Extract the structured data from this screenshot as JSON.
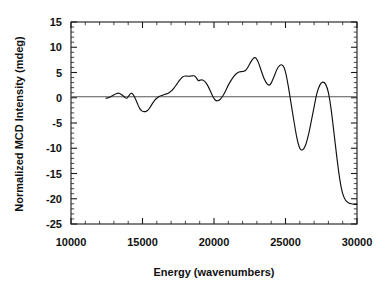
{
  "chart_data": {
    "type": "line",
    "title": "",
    "xlabel": "Energy  (wavenumbers)",
    "ylabel": "Normalized MCD Intensity (mdeg)",
    "xlim": [
      10000,
      30000
    ],
    "ylim": [
      -25,
      15
    ],
    "xticks": [
      10000,
      15000,
      20000,
      25000,
      30000
    ],
    "xtick_labels": [
      "10000",
      "15000",
      "20000",
      "25000",
      "30000"
    ],
    "xminor_step": 1000,
    "yticks": [
      -25,
      -20,
      -15,
      -10,
      -5,
      0,
      5,
      10,
      15
    ],
    "ytick_labels": [
      "-25",
      "-20",
      "-15",
      "-10",
      "-5",
      "0",
      "5",
      "10",
      "15"
    ],
    "yminor_step": 1,
    "grid": false,
    "legend": false,
    "zero_line": true,
    "zero_line_color": "#555555",
    "series_color": "#111111",
    "series": [
      {
        "name": "MCD spectrum",
        "x": [
          12450,
          12700,
          12950,
          13150,
          13350,
          13550,
          13750,
          13900,
          14050,
          14200,
          14350,
          14500,
          14650,
          14800,
          14950,
          15100,
          15250,
          15400,
          15550,
          15700,
          15850,
          16000,
          16200,
          16400,
          16600,
          16800,
          17000,
          17200,
          17400,
          17600,
          17800,
          18000,
          18200,
          18400,
          18600,
          18750,
          18900,
          19050,
          19200,
          19400,
          19600,
          19800,
          19950,
          20100,
          20250,
          20400,
          20600,
          20800,
          21000,
          21250,
          21500,
          21750,
          22000,
          22200,
          22400,
          22600,
          22800,
          22950,
          23100,
          23300,
          23500,
          23700,
          23850,
          24000,
          24200,
          24400,
          24600,
          24750,
          24900,
          25050,
          25200,
          25400,
          25600,
          25800,
          26000,
          26200,
          26400,
          26600,
          26800,
          27000,
          27200,
          27400,
          27600,
          27800,
          28000,
          28200,
          28400,
          28600,
          28800,
          29000,
          29200,
          29400,
          29600,
          29800,
          30000
        ],
        "y": [
          -0.1,
          0.1,
          0.5,
          0.8,
          0.9,
          0.6,
          0.1,
          -0.1,
          0.4,
          0.9,
          0.6,
          -0.2,
          -1.2,
          -2.1,
          -2.6,
          -2.75,
          -2.7,
          -2.4,
          -1.8,
          -1.1,
          -0.5,
          -0.1,
          0.3,
          0.5,
          0.7,
          0.9,
          1.3,
          1.9,
          2.7,
          3.5,
          4.1,
          4.3,
          4.25,
          4.3,
          4.35,
          4.0,
          3.4,
          3.5,
          3.5,
          3.1,
          2.2,
          1.0,
          0.1,
          -0.5,
          -0.6,
          -0.4,
          0.3,
          1.3,
          2.5,
          3.7,
          4.6,
          5.1,
          5.2,
          5.4,
          6.2,
          7.2,
          7.9,
          7.8,
          7.0,
          5.4,
          3.8,
          2.8,
          2.5,
          2.9,
          4.2,
          5.6,
          6.4,
          6.5,
          6.0,
          4.5,
          2.2,
          -1.3,
          -4.8,
          -8.0,
          -10.0,
          -10.3,
          -9.4,
          -7.4,
          -4.7,
          -1.8,
          0.9,
          2.5,
          3.1,
          2.7,
          1.0,
          -2.5,
          -7.2,
          -12.0,
          -16.2,
          -19.0,
          -20.3,
          -20.8,
          -21.0,
          -21.1,
          -21.1
        ]
      }
    ]
  }
}
